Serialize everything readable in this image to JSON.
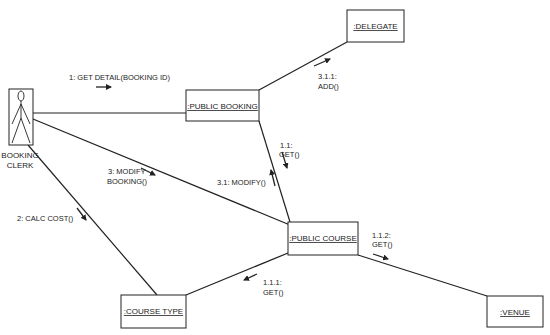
{
  "diagram": {
    "type": "uml-collaboration",
    "actor": {
      "name_line1": "BOOKING",
      "name_line2": "CLERK"
    },
    "objects": {
      "public_booking": ":PUBLIC BOOKING",
      "delegate": ":DELEGATE",
      "public_course": ":PUBLIC COURSE",
      "course_type": ":COURSE TYPE",
      "venue": ":VENUE"
    },
    "messages": {
      "m1": "1: GET DETAIL(BOOKING ID)",
      "m2": "2: CALC COST()",
      "m3_line1": "3: MODIFY",
      "m3_line2": "BOOKING()",
      "m11_line1": "1.1:",
      "m11_line2": "GET()",
      "m31": "3.1: MODIFY()",
      "m311_line1": "3.1.1:",
      "m311_line2": "ADD()",
      "m111_line1": "1.1.1:",
      "m111_line2": "GET()",
      "m112_line1": "1.1.2:",
      "m112_line2": "GET()"
    },
    "colors": {
      "stroke": "#222222",
      "background": "#ffffff"
    }
  }
}
